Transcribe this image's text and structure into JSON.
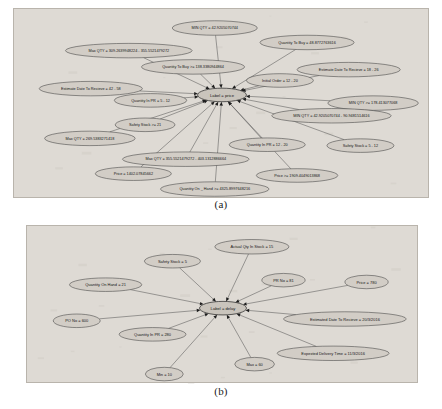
{
  "document": {
    "title": "Feature value graphs for price and delay labels",
    "background_color": "#ffffff",
    "panel_color": "#dedad4",
    "node_fill": "#d2cdc6",
    "node_stroke": "#3d3d3d",
    "edge_color": "#4a4a4a"
  },
  "figures": [
    {
      "id": "figure-a",
      "caption": "(a)",
      "center": {
        "label": "Label = price",
        "cx": 208,
        "cy": 95,
        "rx": 27,
        "ry": 7.5,
        "font_size": 4.6
      },
      "nodes": [
        {
          "label": "MIN QTY = 42.9205070744",
          "cx": 200,
          "cy": 21,
          "rx": 47,
          "ry": 8,
          "font_size": 4.2
        },
        {
          "label": "Quantity To Buy = 48.8772763616",
          "cx": 302,
          "cy": 37,
          "rx": 52,
          "ry": 8,
          "font_size": 4.2
        },
        {
          "label": "Max QTY = 309.2639948224 - 355.5521479272",
          "cx": 105,
          "cy": 46,
          "rx": 70,
          "ry": 8,
          "font_size": 4.2
        },
        {
          "label": "Quantity To Buy >= 138.3380944864",
          "cx": 176,
          "cy": 64,
          "rx": 57,
          "ry": 8,
          "font_size": 4.2
        },
        {
          "label": "Estimate Date To Recieve = 18 - 26",
          "cx": 348,
          "cy": 67,
          "rx": 57,
          "ry": 8,
          "font_size": 4.2
        },
        {
          "label": "Initial Order = 12 - 20",
          "cx": 272,
          "cy": 79,
          "rx": 37,
          "ry": 7.5,
          "font_size": 4.2
        },
        {
          "label": "Estimate Date To Recieve = 42 - 58",
          "cx": 63,
          "cy": 88,
          "rx": 57,
          "ry": 8,
          "font_size": 4.2
        },
        {
          "label": "MIN QTY >= 178.413077068",
          "cx": 375,
          "cy": 104,
          "rx": 50,
          "ry": 8,
          "font_size": 4.2
        },
        {
          "label": "Quantity In PR = 5 - 12",
          "cx": 129,
          "cy": 101,
          "rx": 40,
          "ry": 7.5,
          "font_size": 4.2
        },
        {
          "label": "MIN QTY = 42.9205070744 - 90.9481514616",
          "cx": 329,
          "cy": 118,
          "rx": 66,
          "ry": 8,
          "font_size": 4.2
        },
        {
          "label": "Safety Stock >= 21",
          "cx": 123,
          "cy": 128,
          "rx": 33,
          "ry": 7.5,
          "font_size": 4.2
        },
        {
          "label": "Max QTY = 269.5383271418",
          "cx": 62,
          "cy": 143,
          "rx": 50,
          "ry": 8,
          "font_size": 4.2
        },
        {
          "label": "Quantity In PR = 12 - 20",
          "cx": 258,
          "cy": 150,
          "rx": 42,
          "ry": 7.5,
          "font_size": 4.2
        },
        {
          "label": "Safety Stock = 5 - 12",
          "cx": 361,
          "cy": 151,
          "rx": 37,
          "ry": 7.5,
          "font_size": 4.2
        },
        {
          "label": "Max QTY = 355.5521479272 - 403.1312886664",
          "cx": 168,
          "cy": 166,
          "rx": 70,
          "ry": 8,
          "font_size": 4.2
        },
        {
          "label": "Price = 1402.07845662",
          "cx": 110,
          "cy": 182,
          "rx": 42,
          "ry": 7.5,
          "font_size": 4.2
        },
        {
          "label": "Price >= 1909.4049013868",
          "cx": 291,
          "cy": 184,
          "rx": 45,
          "ry": 7.5,
          "font_size": 4.2
        },
        {
          "label": "Quantity On _ Hand >= 4325.8997648216",
          "cx": 200,
          "cy": 199,
          "rx": 60,
          "ry": 8,
          "font_size": 4.2
        }
      ]
    },
    {
      "id": "figure-b",
      "caption": "(b)",
      "center": {
        "label": "Label = delay",
        "cx": 208,
        "cy": 91,
        "rx": 26,
        "ry": 7.5,
        "font_size": 4.6
      },
      "nodes": [
        {
          "label": "Actual Qty In Stock = 15",
          "cx": 240,
          "cy": 23,
          "rx": 41,
          "ry": 8,
          "font_size": 4.4
        },
        {
          "label": "Safety Stock = 5",
          "cx": 152,
          "cy": 39,
          "rx": 31,
          "ry": 7.5,
          "font_size": 4.4
        },
        {
          "label": "PR No = 81",
          "cx": 275,
          "cy": 60,
          "rx": 24,
          "ry": 7.5,
          "font_size": 4.4
        },
        {
          "label": "Price = 780",
          "cx": 367,
          "cy": 62,
          "rx": 24,
          "ry": 7.5,
          "font_size": 4.4
        },
        {
          "label": "Quantity On Hand = 21",
          "cx": 78,
          "cy": 65,
          "rx": 40,
          "ry": 7.5,
          "font_size": 4.4
        },
        {
          "label": "Estimated Date To Recieve = 20/3/2016",
          "cx": 343,
          "cy": 103,
          "rx": 68,
          "ry": 8,
          "font_size": 4.4
        },
        {
          "label": "PO No = 600",
          "cx": 46,
          "cy": 105,
          "rx": 26,
          "ry": 7.5,
          "font_size": 4.4
        },
        {
          "label": "Quantity In PR = 280",
          "cx": 130,
          "cy": 120,
          "rx": 37,
          "ry": 7.5,
          "font_size": 4.4
        },
        {
          "label": "Expexted Delivery Time = 11/3/2016",
          "cx": 330,
          "cy": 141,
          "rx": 62,
          "ry": 8,
          "font_size": 4.4
        },
        {
          "label": "Max = 60",
          "cx": 243,
          "cy": 153,
          "rx": 22,
          "ry": 7.5,
          "font_size": 4.4
        },
        {
          "label": "Min = 10",
          "cx": 143,
          "cy": 164,
          "rx": 21,
          "ry": 7.5,
          "font_size": 4.4
        }
      ]
    }
  ]
}
